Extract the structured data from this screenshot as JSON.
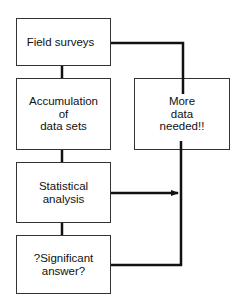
{
  "diagram": {
    "type": "flowchart",
    "nodes": [
      {
        "id": "field_surveys",
        "label": "Field surveys"
      },
      {
        "id": "accumulation",
        "lines": [
          "Accumulation",
          "of",
          "data sets"
        ]
      },
      {
        "id": "statistical",
        "lines": [
          "Statistical",
          "analysis"
        ]
      },
      {
        "id": "significant",
        "lines": [
          "?Significant",
          "answer?"
        ]
      },
      {
        "id": "more_data",
        "lines": [
          "More",
          "data",
          "needed!!"
        ]
      }
    ],
    "edges": [
      {
        "from": "field_surveys",
        "to": "accumulation"
      },
      {
        "from": "accumulation",
        "to": "statistical"
      },
      {
        "from": "statistical",
        "to": "significant"
      },
      {
        "from": "statistical",
        "to": "more_data"
      },
      {
        "from": "significant",
        "to": "more_data"
      },
      {
        "from": "more_data",
        "to": "field_surveys"
      }
    ],
    "line_color": "#111111"
  }
}
